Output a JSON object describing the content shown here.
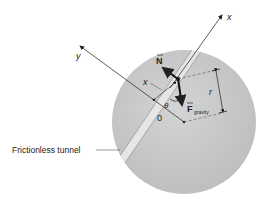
{
  "diagram": {
    "labels": {
      "x_axis": "x",
      "y_axis": "y",
      "normal_force": "N",
      "gravity_force": "F",
      "gravity_subscript": "gravity",
      "angle": "θ",
      "origin": "0",
      "displacement": "x",
      "radius": "r",
      "tunnel": "Frictionless tunnel"
    },
    "colors": {
      "sphere": "#c9c9c9",
      "tunnel": "#e2e2e2",
      "ink": "#222222"
    }
  }
}
